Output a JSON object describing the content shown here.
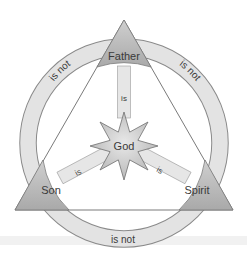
{
  "nodes": {
    "top": {
      "label": "Father"
    },
    "left": {
      "label": "Son"
    },
    "right": {
      "label": "Spirit"
    },
    "center": {
      "label": "God"
    }
  },
  "links": {
    "top_center": "is",
    "left_center": "is",
    "right_center": "is",
    "top_left": "is not",
    "top_right": "is not",
    "left_right": "is not"
  },
  "colors": {
    "ring_fill": "#e3e3e3",
    "ring_stroke": "#8a8a8a",
    "node_fill": "#bdbdbd",
    "star_fill": "#cfcfcf",
    "spoke_fill": "#e6e6e6",
    "line": "#7a7a7a",
    "text": "#3a3a3a"
  }
}
